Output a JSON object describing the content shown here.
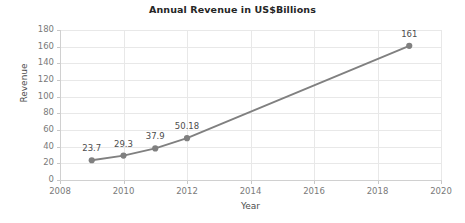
{
  "chart_data": {
    "type": "line",
    "title": "Annual Revenue in US$Billions",
    "xlabel": "Year",
    "ylabel": "Revenue",
    "x": [
      2009,
      2010,
      2011,
      2012,
      2019
    ],
    "values": [
      23.7,
      29.3,
      37.9,
      50.18,
      161
    ],
    "point_labels": [
      "23.7",
      "29.3",
      "37.9",
      "50.18",
      "161"
    ],
    "xlim": [
      2008,
      2020
    ],
    "ylim": [
      0,
      180
    ],
    "xticks": [
      2008,
      2010,
      2012,
      2014,
      2016,
      2018,
      2020
    ],
    "xtick_labels": [
      "2008",
      "2010",
      "2012",
      "2014",
      "2016",
      "2018",
      "2020"
    ],
    "yticks": [
      0,
      20,
      40,
      60,
      80,
      100,
      120,
      140,
      160,
      180
    ],
    "ytick_labels": [
      "0",
      "20",
      "40",
      "60",
      "80",
      "100",
      "120",
      "140",
      "160",
      "180"
    ],
    "grid": true,
    "legend": false,
    "series": [
      {
        "name": "Revenue",
        "values": [
          23.7,
          29.3,
          37.9,
          50.18,
          161
        ]
      }
    ],
    "colors": {
      "line": "#808080",
      "marker": "#808080",
      "grid": "#e8e8e8",
      "axis": "#d0d0d0",
      "tick_text": "#7a7a7a",
      "title_text": "#262626",
      "axis_title_text": "#4d4d4d",
      "background": "#ffffff"
    }
  }
}
